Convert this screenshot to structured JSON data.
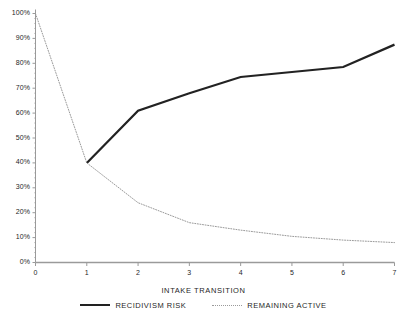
{
  "chart_data": {
    "type": "line",
    "title": "",
    "xlabel": "INTAKE TRANSITION",
    "ylabel": "",
    "xlim": [
      0,
      7
    ],
    "ylim": [
      0,
      100
    ],
    "grid": false,
    "legend_position": "bottom",
    "x": [
      0,
      1,
      2,
      3,
      4,
      5,
      6,
      7
    ],
    "x_tick_labels": [
      "0",
      "1",
      "2",
      "3",
      "4",
      "5",
      "6",
      "7"
    ],
    "y_tick_values": [
      0,
      10,
      20,
      30,
      40,
      50,
      60,
      70,
      80,
      90,
      100
    ],
    "y_tick_labels": [
      "0%",
      "10%",
      "20%",
      "30%",
      "40%",
      "50%",
      "60%",
      "70%",
      "80%",
      "90%",
      "100%"
    ],
    "series": [
      {
        "name": "RECIDIVISM RISK",
        "style": "solid",
        "color": "#222222",
        "width": 2.2,
        "x": [
          1,
          2,
          3,
          4,
          5,
          6,
          7
        ],
        "values": [
          40,
          61,
          68,
          74.5,
          76.5,
          78.5,
          87.5
        ]
      },
      {
        "name": "REMAINING ACTIVE",
        "style": "dotted",
        "color": "#9a9a9a",
        "width": 1,
        "x": [
          0,
          1,
          2,
          3,
          4,
          5,
          6,
          7
        ],
        "values": [
          100,
          40,
          24,
          16,
          13,
          10.5,
          9,
          8
        ]
      }
    ]
  },
  "axis": {
    "line_color": "#9a9a9a",
    "tick_color": "#9a9a9a"
  },
  "legend": {
    "items": [
      {
        "label": "RECIDIVISM RISK",
        "style": "solid"
      },
      {
        "label": "REMAINING ACTIVE",
        "style": "dotted"
      }
    ]
  },
  "x_axis_title": "INTAKE TRANSITION"
}
